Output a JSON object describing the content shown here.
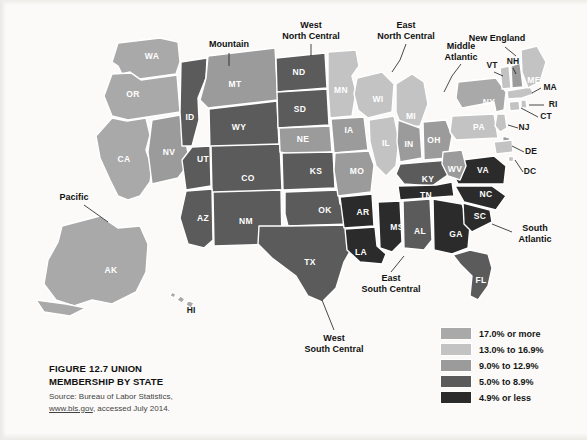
{
  "figure": {
    "number": "FIGURE 12.7",
    "title": "UNION",
    "title_line2": "MEMBERSHIP BY STATE",
    "source_line1": "Source: Bureau of Labor Statistics,",
    "source_url": "www.bls.gov",
    "source_line2_rest": ", accessed July 2014."
  },
  "legend": {
    "items": [
      {
        "label": "17.0% or more",
        "color": "#a9a9a9"
      },
      {
        "label": "13.0% to 16.9%",
        "color": "#c3c3c3"
      },
      {
        "label": "9.0% to 12.9%",
        "color": "#9b9b9b"
      },
      {
        "label": "5.0% to 8.9%",
        "color": "#5b5b5b"
      },
      {
        "label": "4.9% or less",
        "color": "#2b2b2b"
      }
    ]
  },
  "regions": [
    {
      "name": "Pacific",
      "x": 74,
      "y": 200,
      "lines": [
        "Pacific"
      ]
    },
    {
      "name": "Mountain",
      "x": 229,
      "y": 47,
      "lines": [
        "Mountain"
      ]
    },
    {
      "name": "West North Central",
      "x": 311,
      "y": 28,
      "lines": [
        "West",
        "North Central"
      ]
    },
    {
      "name": "East North Central",
      "x": 406,
      "y": 28,
      "lines": [
        "East",
        "North Central"
      ]
    },
    {
      "name": "Middle Atlantic",
      "x": 461,
      "y": 49,
      "lines": [
        "Middle",
        "Atlantic"
      ]
    },
    {
      "name": "New England",
      "x": 497,
      "y": 41,
      "lines": [
        "New England"
      ]
    },
    {
      "name": "South Atlantic",
      "x": 535,
      "y": 231,
      "lines": [
        "South",
        "Atlantic"
      ]
    },
    {
      "name": "East South Central",
      "x": 391,
      "y": 281,
      "lines": [
        "East",
        "South Central"
      ]
    },
    {
      "name": "West South Central",
      "x": 334,
      "y": 341,
      "lines": [
        "West",
        "South Central"
      ]
    }
  ],
  "chart_data": {
    "type": "map",
    "title": "Union Membership by State",
    "value_label": "Percent of workers who are union members",
    "bins": [
      "17.0% or more",
      "13.0% to 16.9%",
      "9.0% to 12.9%",
      "5.0% to 8.9%",
      "4.9% or less"
    ],
    "bin_colors": [
      "#a9a9a9",
      "#c3c3c3",
      "#9b9b9b",
      "#5b5b5b",
      "#2b2b2b"
    ],
    "states": [
      {
        "code": "WA",
        "bin": 0
      },
      {
        "code": "OR",
        "bin": 0
      },
      {
        "code": "CA",
        "bin": 0
      },
      {
        "code": "AK",
        "bin": 0
      },
      {
        "code": "HI",
        "bin": 0
      },
      {
        "code": "NV",
        "bin": 2
      },
      {
        "code": "ID",
        "bin": 3
      },
      {
        "code": "MT",
        "bin": 2
      },
      {
        "code": "WY",
        "bin": 3
      },
      {
        "code": "UT",
        "bin": 3
      },
      {
        "code": "CO",
        "bin": 3
      },
      {
        "code": "AZ",
        "bin": 3
      },
      {
        "code": "NM",
        "bin": 3
      },
      {
        "code": "ND",
        "bin": 3
      },
      {
        "code": "SD",
        "bin": 3
      },
      {
        "code": "NE",
        "bin": 2
      },
      {
        "code": "KS",
        "bin": 3
      },
      {
        "code": "OK",
        "bin": 3
      },
      {
        "code": "TX",
        "bin": 3
      },
      {
        "code": "MN",
        "bin": 1
      },
      {
        "code": "IA",
        "bin": 2
      },
      {
        "code": "MO",
        "bin": 2
      },
      {
        "code": "AR",
        "bin": 4
      },
      {
        "code": "LA",
        "bin": 4
      },
      {
        "code": "WI",
        "bin": 1
      },
      {
        "code": "IL",
        "bin": 1
      },
      {
        "code": "MI",
        "bin": 1
      },
      {
        "code": "IN",
        "bin": 2
      },
      {
        "code": "OH",
        "bin": 2
      },
      {
        "code": "KY",
        "bin": 3
      },
      {
        "code": "TN",
        "bin": 4
      },
      {
        "code": "MS",
        "bin": 4
      },
      {
        "code": "AL",
        "bin": 3
      },
      {
        "code": "GA",
        "bin": 4
      },
      {
        "code": "FL",
        "bin": 3
      },
      {
        "code": "SC",
        "bin": 4
      },
      {
        "code": "NC",
        "bin": 4
      },
      {
        "code": "VA",
        "bin": 4
      },
      {
        "code": "WV",
        "bin": 2
      },
      {
        "code": "PA",
        "bin": 1
      },
      {
        "code": "NY",
        "bin": 0
      },
      {
        "code": "NJ",
        "bin": 1
      },
      {
        "code": "DE",
        "bin": 2
      },
      {
        "code": "MD",
        "bin": 1
      },
      {
        "code": "DC",
        "bin": 1
      },
      {
        "code": "CT",
        "bin": 1
      },
      {
        "code": "RI",
        "bin": 1
      },
      {
        "code": "MA",
        "bin": 1
      },
      {
        "code": "VT",
        "bin": 1
      },
      {
        "code": "NH",
        "bin": 2
      },
      {
        "code": "ME",
        "bin": 1
      }
    ],
    "labels_inside": [
      {
        "code": "WA",
        "x": 152,
        "y": 57
      },
      {
        "code": "OR",
        "x": 133,
        "y": 95
      },
      {
        "code": "CA",
        "x": 124,
        "y": 160
      },
      {
        "code": "NV",
        "x": 169,
        "y": 153
      },
      {
        "code": "ID",
        "x": 190,
        "y": 118
      },
      {
        "code": "MT",
        "x": 235,
        "y": 85
      },
      {
        "code": "WY",
        "x": 239,
        "y": 128
      },
      {
        "code": "UT",
        "x": 203,
        "y": 160
      },
      {
        "code": "CO",
        "x": 248,
        "y": 179
      },
      {
        "code": "AZ",
        "x": 203,
        "y": 219
      },
      {
        "code": "NM",
        "x": 246,
        "y": 222
      },
      {
        "code": "ND",
        "x": 299,
        "y": 73
      },
      {
        "code": "SD",
        "x": 300,
        "y": 110
      },
      {
        "code": "NE",
        "x": 303,
        "y": 140
      },
      {
        "code": "KS",
        "x": 316,
        "y": 172
      },
      {
        "code": "OK",
        "x": 325,
        "y": 211
      },
      {
        "code": "TX",
        "x": 310,
        "y": 263
      },
      {
        "code": "MN",
        "x": 341,
        "y": 91
      },
      {
        "code": "IA",
        "x": 349,
        "y": 131
      },
      {
        "code": "MO",
        "x": 357,
        "y": 172
      },
      {
        "code": "AR",
        "x": 363,
        "y": 213
      },
      {
        "code": "LA",
        "x": 361,
        "y": 253
      },
      {
        "code": "WI",
        "x": 378,
        "y": 100
      },
      {
        "code": "IL",
        "x": 386,
        "y": 144
      },
      {
        "code": "MI",
        "x": 411,
        "y": 117
      },
      {
        "code": "IN",
        "x": 409,
        "y": 145
      },
      {
        "code": "OH",
        "x": 434,
        "y": 141
      },
      {
        "code": "KY",
        "x": 428,
        "y": 180
      },
      {
        "code": "TN",
        "x": 426,
        "y": 196
      },
      {
        "code": "MS",
        "x": 397,
        "y": 228
      },
      {
        "code": "AL",
        "x": 420,
        "y": 232
      },
      {
        "code": "GA",
        "x": 456,
        "y": 235
      },
      {
        "code": "FL",
        "x": 481,
        "y": 281
      },
      {
        "code": "SC",
        "x": 480,
        "y": 217
      },
      {
        "code": "NC",
        "x": 486,
        "y": 195
      },
      {
        "code": "VA",
        "x": 483,
        "y": 171
      },
      {
        "code": "WV",
        "x": 455,
        "y": 170
      },
      {
        "code": "PA",
        "x": 479,
        "y": 128
      },
      {
        "code": "NY",
        "x": 489,
        "y": 103
      },
      {
        "code": "AK",
        "x": 111,
        "y": 271
      },
      {
        "code": "ME",
        "x": 534,
        "y": 81
      }
    ],
    "labels_outside": [
      {
        "code": "VT",
        "x": 492,
        "y": 66
      },
      {
        "code": "NH",
        "x": 513,
        "y": 62
      },
      {
        "code": "MA",
        "x": 550,
        "y": 88
      },
      {
        "code": "RI",
        "x": 553,
        "y": 105
      },
      {
        "code": "CT",
        "x": 546,
        "y": 117
      },
      {
        "code": "NJ",
        "x": 524,
        "y": 128
      },
      {
        "code": "DE",
        "x": 531,
        "y": 152
      },
      {
        "code": "DC",
        "x": 530,
        "y": 172
      },
      {
        "code": "HI",
        "x": 191,
        "y": 311
      }
    ]
  }
}
